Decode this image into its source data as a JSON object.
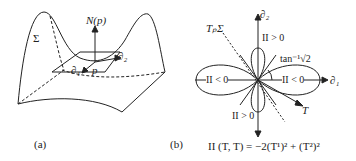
{
  "panel_a": {
    "caption": "(a)",
    "surface_label": "Σ",
    "normal_label": "N(p)",
    "point_label": "p",
    "tangent1_label": "∂₁",
    "tangent2_label": "∂₂"
  },
  "panel_b": {
    "caption": "(b)",
    "axis1_label": "∂₁",
    "axis2_label": "∂₂",
    "tangent_plane_label": "TₚΣ",
    "vector_label": "T",
    "angle_label": "tan⁻¹√2",
    "region_top": "II > 0",
    "region_bottom": "II > 0",
    "region_left": "II < 0",
    "region_right": "II < 0",
    "formula": "II (T, T) = −2(T¹)² + (T²)²"
  }
}
